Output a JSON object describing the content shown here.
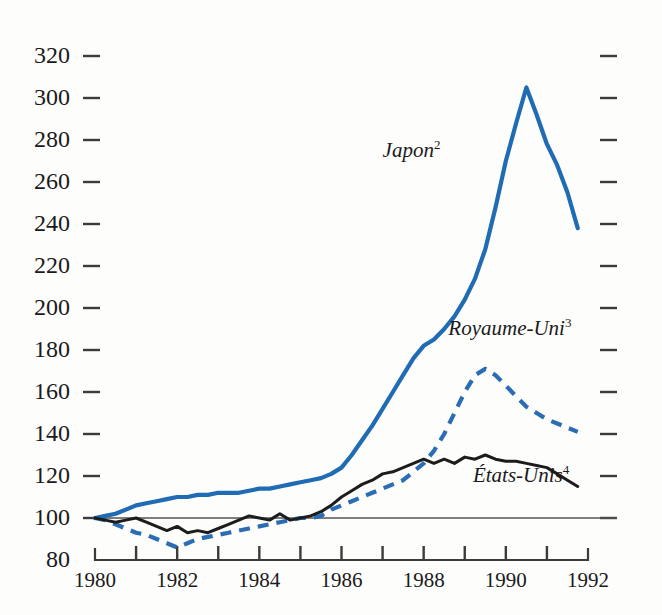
{
  "chart_data": {
    "type": "line",
    "title": "",
    "subtitle": "",
    "xlabel": "",
    "ylabel": "",
    "xlim": [
      1980,
      1992
    ],
    "ylim": [
      80,
      330
    ],
    "yticks": [
      80,
      100,
      120,
      140,
      160,
      180,
      200,
      220,
      240,
      260,
      280,
      300,
      320
    ],
    "ytick_labels": [
      "80",
      "100",
      "120",
      "140",
      "160",
      "180",
      "200",
      "220",
      "240",
      "260",
      "280",
      "300",
      "320"
    ],
    "xticks": [
      1980,
      1981,
      1982,
      1983,
      1984,
      1985,
      1986,
      1987,
      1988,
      1989,
      1990,
      1991,
      1992
    ],
    "xtick_labels_shown": [
      "1980",
      "1982",
      "1984",
      "1986",
      "1988",
      "1990",
      "1992"
    ],
    "grid": false,
    "legend_position": "inline-annotations",
    "baseline_value": 100,
    "colors": {
      "japan": "#1f6cb4",
      "royaume_uni": "#2a6db5",
      "etats_unis": "#1c1c1c",
      "axis": "#3b3b3b",
      "background": "#fdfdfb"
    },
    "series": [
      {
        "name": "Japon",
        "footnote": "2",
        "label_text": "Japon",
        "label_sup": "2",
        "style": "solid",
        "color": "#1f6cb4",
        "x": [
          1980.0,
          1980.25,
          1980.5,
          1980.75,
          1981.0,
          1981.25,
          1981.5,
          1981.75,
          1982.0,
          1982.25,
          1982.5,
          1982.75,
          1983.0,
          1983.25,
          1983.5,
          1983.75,
          1984.0,
          1984.25,
          1984.5,
          1984.75,
          1985.0,
          1985.25,
          1985.5,
          1985.75,
          1986.0,
          1986.25,
          1986.5,
          1986.75,
          1987.0,
          1987.25,
          1987.5,
          1987.75,
          1988.0,
          1988.25,
          1988.5,
          1988.75,
          1989.0,
          1989.25,
          1989.5,
          1989.75,
          1990.0,
          1990.25,
          1990.5,
          1990.75,
          1991.0,
          1991.25,
          1991.5,
          1991.75
        ],
        "y": [
          100,
          101,
          102,
          104,
          106,
          107,
          108,
          109,
          110,
          110,
          111,
          111,
          112,
          112,
          112,
          113,
          114,
          114,
          115,
          116,
          117,
          118,
          119,
          121,
          124,
          130,
          137,
          144,
          152,
          160,
          168,
          176,
          182,
          185,
          190,
          196,
          204,
          214,
          228,
          248,
          270,
          288,
          305,
          292,
          278,
          268,
          255,
          238
        ],
        "annotation": {
          "x": 1987.0,
          "y": 272
        }
      },
      {
        "name": "Royaume-Uni",
        "footnote": "3",
        "label_text": "Royaume-Uni",
        "label_sup": "3",
        "style": "dashed",
        "color": "#2a6db5",
        "x": [
          1980.0,
          1980.25,
          1980.5,
          1980.75,
          1981.0,
          1981.25,
          1981.5,
          1981.75,
          1982.0,
          1982.25,
          1982.5,
          1982.75,
          1983.0,
          1983.25,
          1983.5,
          1983.75,
          1984.0,
          1984.25,
          1984.5,
          1984.75,
          1985.0,
          1985.25,
          1985.5,
          1985.75,
          1986.0,
          1986.25,
          1986.5,
          1986.75,
          1987.0,
          1987.25,
          1987.5,
          1987.75,
          1988.0,
          1988.25,
          1988.5,
          1988.75,
          1989.0,
          1989.25,
          1989.5,
          1989.75,
          1990.0,
          1990.25,
          1990.5,
          1990.75,
          1991.0,
          1991.25,
          1991.5,
          1991.75
        ],
        "y": [
          100,
          99,
          97,
          95,
          93,
          92,
          90,
          88,
          86,
          88,
          90,
          91,
          92,
          93,
          94,
          95,
          96,
          97,
          98,
          99,
          100,
          100,
          101,
          104,
          106,
          108,
          110,
          112,
          114,
          116,
          118,
          122,
          126,
          132,
          140,
          150,
          160,
          168,
          171,
          168,
          163,
          158,
          153,
          150,
          147,
          145,
          143,
          141
        ],
        "annotation": {
          "x": 1988.6,
          "y": 187
        }
      },
      {
        "name": "États-Unis",
        "footnote": "4",
        "label_text": "États-Unis",
        "label_sup": "4",
        "style": "solid",
        "color": "#1c1c1c",
        "x": [
          1980.0,
          1980.25,
          1980.5,
          1980.75,
          1981.0,
          1981.25,
          1981.5,
          1981.75,
          1982.0,
          1982.25,
          1982.5,
          1982.75,
          1983.0,
          1983.25,
          1983.5,
          1983.75,
          1984.0,
          1984.25,
          1984.5,
          1984.75,
          1985.0,
          1985.25,
          1985.5,
          1985.75,
          1986.0,
          1986.25,
          1986.5,
          1986.75,
          1987.0,
          1987.25,
          1987.5,
          1987.75,
          1988.0,
          1988.25,
          1988.5,
          1988.75,
          1989.0,
          1989.25,
          1989.5,
          1989.75,
          1990.0,
          1990.25,
          1990.5,
          1990.75,
          1991.0,
          1991.25,
          1991.5,
          1991.75
        ],
        "y": [
          100,
          99,
          98,
          99,
          100,
          98,
          96,
          94,
          96,
          93,
          94,
          93,
          95,
          97,
          99,
          101,
          100,
          99,
          102,
          99,
          100,
          101,
          103,
          106,
          110,
          113,
          116,
          118,
          121,
          122,
          124,
          126,
          128,
          126,
          128,
          126,
          129,
          128,
          130,
          128,
          127,
          127,
          126,
          125,
          124,
          121,
          118,
          115
        ],
        "annotation": {
          "x": 1989.2,
          "y": 117
        }
      }
    ]
  },
  "axes": {
    "y_axis_name": "index-axis",
    "x_axis_name": "year-axis",
    "right_ticks_present": true
  }
}
